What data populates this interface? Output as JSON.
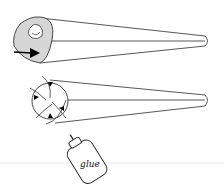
{
  "figure": {
    "panels": [
      {
        "name": "cone-rolled",
        "description": "Rolled cone with inner curl and push arrow"
      },
      {
        "name": "cone-folded",
        "description": "Cone with folded tabs and arrows"
      }
    ],
    "glue_bottle": {
      "label": "glue"
    },
    "colors": {
      "stroke": "#333333",
      "fill_gray": "#d9d9d9",
      "divider": "#e6e6e6"
    }
  }
}
